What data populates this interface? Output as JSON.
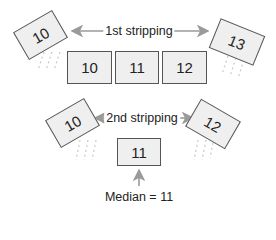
{
  "diagram": {
    "top_row": {
      "label": "1st stripping",
      "removed_left": "10",
      "removed_right": "13",
      "remaining": [
        "10",
        "11",
        "12"
      ]
    },
    "bottom_row": {
      "label": "2nd stripping",
      "removed_left": "10",
      "removed_right": "12",
      "remaining": "11"
    },
    "result_label": "Median = 11",
    "colors": {
      "box_fill": "#efefef",
      "box_border": "#555555",
      "arrow": "#9a9a9a",
      "text": "#222222"
    }
  }
}
